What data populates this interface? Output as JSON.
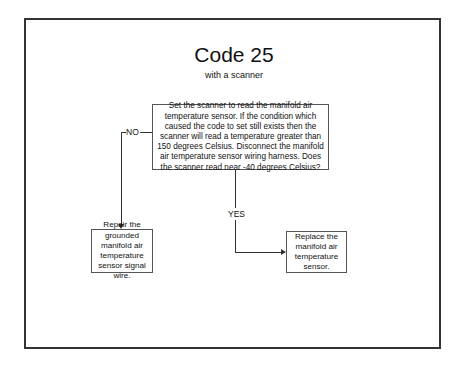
{
  "diagram": {
    "title": "Code 25",
    "subtitle": "with a scanner",
    "question": "Set the scanner to read the manifold air temperature sensor. If the condition which caused the code to set still exists then the scanner will read a temperature greater than 150 degrees Celsius. Disconnect the manifold air temperature sensor wiring harness. Does the scanner read near -40 degrees Celsius?",
    "no_label": "NO",
    "yes_label": "YES",
    "no_action": "Repair the grounded manifold air temperature sensor signal wire.",
    "yes_action": "Replace the manifold air temperature sensor."
  }
}
